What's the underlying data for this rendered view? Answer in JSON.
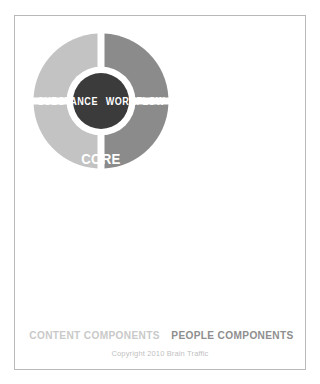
{
  "diagram": {
    "center": {
      "line1": "CORE",
      "line2": "STRATEGY",
      "fill": "#3b3b3b",
      "ring": "#ffffff"
    },
    "quadrants": [
      {
        "id": "substance",
        "label": "SUBSTANCE",
        "position": "top-left",
        "group": "content",
        "fill": "#c3c3c3",
        "text_color": "#ffffff"
      },
      {
        "id": "workflow",
        "label": "WORKFLOW",
        "position": "top-right",
        "group": "people",
        "fill": "#8b8b8b",
        "text_color": "#ffffff"
      },
      {
        "id": "structure",
        "label": "STRUCTURE",
        "position": "bottom-left",
        "group": "content",
        "fill": "#c3c3c3",
        "text_color": "#ffffff"
      },
      {
        "id": "governance",
        "label": "GOVERNANCE",
        "position": "bottom-right",
        "group": "people",
        "fill": "#8b8b8b",
        "text_color": "#ffffff"
      }
    ],
    "captions": {
      "content": "CONTENT COMPONENTS",
      "people": "PEOPLE COMPONENTS",
      "content_color": "#c9c9c9",
      "people_color": "#8e8e8e"
    },
    "copyright": "Copyright 2010 Brain Traffic",
    "frame_border_color": "#b9b9b9",
    "background": "#ffffff"
  }
}
